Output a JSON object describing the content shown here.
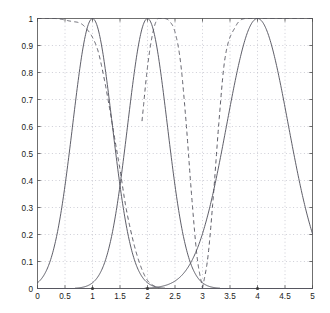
{
  "chart_data": {
    "type": "line",
    "title": "",
    "xlabel": "",
    "ylabel": "",
    "xlim": [
      0,
      5
    ],
    "ylim": [
      0,
      1
    ],
    "grid": true,
    "legend_position": "none",
    "xticks": [
      "0",
      "0.5",
      "1",
      "1.5",
      "2",
      "2.5",
      "3",
      "3.5",
      "4",
      "4.5",
      "5"
    ],
    "xtick_values": [
      0,
      0.5,
      1,
      1.5,
      2,
      2.5,
      3,
      3.5,
      4,
      4.5,
      5
    ],
    "yticks": [
      "0",
      "0.1",
      "0.2",
      "0.3",
      "0.4",
      "0.5",
      "0.6",
      "0.7",
      "0.8",
      "0.9",
      "1"
    ],
    "ytick_values": [
      0,
      0.1,
      0.2,
      0.3,
      0.4,
      0.5,
      0.6,
      0.7,
      0.8,
      0.9,
      1
    ],
    "markers": {
      "style": "dot",
      "y": 0,
      "x": [
        1,
        2,
        4
      ]
    },
    "series": [
      {
        "name": "solid-peak-1",
        "style": "solid",
        "type": "gaussian",
        "center": 1.0,
        "sigma": 0.36,
        "peak": 1.0,
        "x": [
          0,
          0.1,
          0.2,
          0.3,
          0.4,
          0.5,
          0.6,
          0.7,
          0.8,
          0.9,
          1.0,
          1.1,
          1.2,
          1.3,
          1.4,
          1.5,
          1.6,
          1.7,
          1.8,
          1.9,
          2.0,
          2.2,
          2.4,
          2.6
        ],
        "values": [
          0.09,
          0.16,
          0.25,
          0.36,
          0.48,
          0.61,
          0.74,
          0.85,
          0.94,
          0.99,
          1.0,
          0.99,
          0.94,
          0.85,
          0.74,
          0.61,
          0.48,
          0.36,
          0.25,
          0.16,
          0.09,
          0.03,
          0.01,
          0.0
        ]
      },
      {
        "name": "solid-peak-2",
        "style": "solid",
        "type": "gaussian",
        "center": 2.0,
        "sigma": 0.36,
        "peak": 1.0,
        "x": [
          0.8,
          1.0,
          1.2,
          1.4,
          1.5,
          1.6,
          1.7,
          1.8,
          1.9,
          2.0,
          2.1,
          2.2,
          2.3,
          2.4,
          2.5,
          2.6,
          2.8,
          3.0,
          3.2
        ],
        "values": [
          0.0,
          0.02,
          0.06,
          0.21,
          0.31,
          0.44,
          0.59,
          0.74,
          0.88,
          1.0,
          0.88,
          0.74,
          0.59,
          0.44,
          0.31,
          0.21,
          0.06,
          0.01,
          0.0
        ]
      },
      {
        "name": "solid-peak-4",
        "style": "solid",
        "type": "gaussian",
        "center": 4.0,
        "sigma": 0.56,
        "peak": 1.0,
        "x": [
          2.6,
          2.8,
          3.0,
          3.2,
          3.4,
          3.6,
          3.8,
          4.0,
          4.2,
          4.4,
          4.6,
          4.8,
          5.0
        ],
        "values": [
          0.01,
          0.05,
          0.14,
          0.3,
          0.5,
          0.72,
          0.9,
          1.0,
          0.9,
          0.72,
          0.5,
          0.3,
          0.09
        ]
      },
      {
        "name": "dashed-left-shoulder",
        "style": "dashed",
        "type": "shoulder",
        "x": [
          0.0,
          0.3,
          0.6,
          0.8,
          0.9,
          1.0,
          1.1,
          1.2,
          1.3,
          1.4,
          1.5,
          1.6,
          1.7,
          1.8,
          1.9,
          2.0,
          2.2
        ],
        "values": [
          1.0,
          1.0,
          0.99,
          0.98,
          0.96,
          0.93,
          0.88,
          0.79,
          0.68,
          0.56,
          0.44,
          0.31,
          0.21,
          0.13,
          0.07,
          0.03,
          0.0
        ]
      },
      {
        "name": "dashed-mid-bump",
        "style": "dashed",
        "type": "plateau",
        "x": [
          1.9,
          2.0,
          2.1,
          2.2,
          2.3,
          2.4,
          2.5,
          2.6,
          2.7,
          2.8,
          2.9,
          3.0
        ],
        "values": [
          0.62,
          0.82,
          0.95,
          1.0,
          1.0,
          0.99,
          0.95,
          0.84,
          0.62,
          0.35,
          0.12,
          0.0
        ]
      },
      {
        "name": "dashed-right-shoulder",
        "style": "dashed",
        "type": "plateau",
        "x": [
          3.0,
          3.1,
          3.2,
          3.3,
          3.4,
          3.6,
          3.8,
          4.0,
          4.5,
          5.0
        ],
        "values": [
          0.0,
          0.12,
          0.35,
          0.62,
          0.84,
          0.97,
          1.0,
          1.0,
          1.0,
          1.0
        ]
      }
    ]
  }
}
